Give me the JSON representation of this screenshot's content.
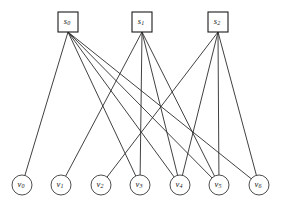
{
  "diagram": {
    "type": "bipartite-graph",
    "canvas": {
      "width": 285,
      "height": 206,
      "background": "#ffffff"
    },
    "style": {
      "edge_color": "#2b2b2b",
      "node_stroke": "#1a1a1a",
      "node_fill": "#ffffff",
      "edge_width": 0.9
    },
    "source_nodes": [
      {
        "id": "s0",
        "base": "s",
        "sub": "0",
        "x": 68,
        "y": 22,
        "w": 20,
        "h": 20
      },
      {
        "id": "s1",
        "base": "s",
        "sub": "1",
        "x": 142,
        "y": 22,
        "w": 20,
        "h": 20
      },
      {
        "id": "s2",
        "base": "s",
        "sub": "2",
        "x": 218,
        "y": 22,
        "w": 20,
        "h": 20
      }
    ],
    "sink_nodes": [
      {
        "id": "v0",
        "base": "v",
        "sub": "0",
        "x": 22,
        "y": 185,
        "r": 10
      },
      {
        "id": "v1",
        "base": "v",
        "sub": "1",
        "x": 61,
        "y": 185,
        "r": 10
      },
      {
        "id": "v2",
        "base": "v",
        "sub": "2",
        "x": 101,
        "y": 185,
        "r": 10
      },
      {
        "id": "v3",
        "base": "v",
        "sub": "3",
        "x": 140,
        "y": 185,
        "r": 10
      },
      {
        "id": "v4",
        "base": "v",
        "sub": "4",
        "x": 180,
        "y": 185,
        "r": 10
      },
      {
        "id": "v5",
        "base": "v",
        "sub": "5",
        "x": 219,
        "y": 185,
        "r": 10
      },
      {
        "id": "v6",
        "base": "v",
        "sub": "6",
        "x": 259,
        "y": 185,
        "r": 10
      }
    ],
    "edges": [
      {
        "from": "s0",
        "to": "v0"
      },
      {
        "from": "s0",
        "to": "v3"
      },
      {
        "from": "s0",
        "to": "v4"
      },
      {
        "from": "s0",
        "to": "v5"
      },
      {
        "from": "s0",
        "to": "v6"
      },
      {
        "from": "s1",
        "to": "v1"
      },
      {
        "from": "s1",
        "to": "v3"
      },
      {
        "from": "s1",
        "to": "v4"
      },
      {
        "from": "s1",
        "to": "v5"
      },
      {
        "from": "s2",
        "to": "v2"
      },
      {
        "from": "s2",
        "to": "v4"
      },
      {
        "from": "s2",
        "to": "v5"
      },
      {
        "from": "s2",
        "to": "v6"
      }
    ],
    "degrees": {
      "s0": 5,
      "s1": 4,
      "s2": 4,
      "v0": 1,
      "v1": 1,
      "v2": 1,
      "v3": 2,
      "v4": 3,
      "v5": 3,
      "v6": 2
    }
  }
}
